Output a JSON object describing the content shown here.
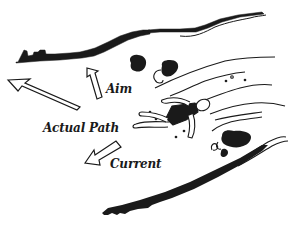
{
  "diagram": {
    "title": "",
    "labels": {
      "aim": "Aim",
      "actual_path": "Actual Path",
      "current": "Current"
    },
    "arrows": [
      {
        "name": "aim-arrow",
        "direction": "up-left",
        "style": "hollow"
      },
      {
        "name": "actual-path-arrow",
        "direction": "left-up",
        "style": "hollow-long"
      },
      {
        "name": "current-arrow",
        "direction": "down-left",
        "style": "hollow"
      }
    ],
    "elements": [
      "top-bank",
      "bottom-bank",
      "rocks",
      "water-swirls",
      "swimmer"
    ],
    "colors": {
      "ink": "#1a1a1a",
      "background": "#ffffff"
    }
  }
}
